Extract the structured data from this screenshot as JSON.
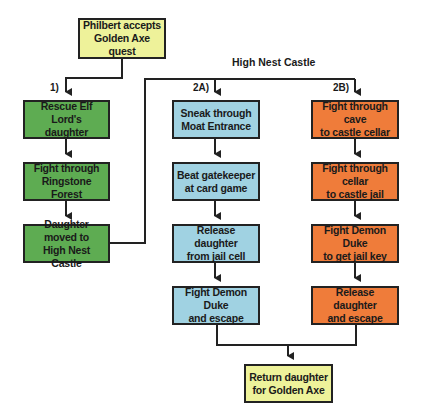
{
  "diagram": {
    "title": "High Nest Castle",
    "colors": {
      "start_end": "#eef29a",
      "path1": "#5eac52",
      "path2a": "#a0d2e2",
      "path2b": "#ef7c3a",
      "line": "#222222"
    },
    "start": {
      "line1": "Philbert accepts",
      "line2": "Golden Axe quest"
    },
    "branch_labels": {
      "b1": "1)",
      "b2a": "2A)",
      "b2b": "2B)"
    },
    "path1": [
      {
        "line1": "Rescue Elf Lord's",
        "line2": "daughter"
      },
      {
        "line1": "Fight through",
        "line2": "Ringstone Forest"
      },
      {
        "line1": "Daughter moved to",
        "line2": "High Nest Castle"
      }
    ],
    "path2a": [
      {
        "line1": "Sneak through",
        "line2": "Moat Entrance"
      },
      {
        "line1": "Beat gatekeeper",
        "line2": "at card game"
      },
      {
        "line1": "Release daughter",
        "line2": "from jail cell"
      },
      {
        "line1": "Fight Demon Duke",
        "line2": "and escape"
      }
    ],
    "path2b": [
      {
        "line1": "Fight through cave",
        "line2": "to castle cellar"
      },
      {
        "line1": "Fight through cellar",
        "line2": "to castle jail"
      },
      {
        "line1": "Fight Demon Duke",
        "line2": "to get jail key"
      },
      {
        "line1": "Release daughter",
        "line2": "and escape"
      }
    ],
    "end": {
      "line1": "Return daughter",
      "line2": "for Golden Axe"
    }
  }
}
